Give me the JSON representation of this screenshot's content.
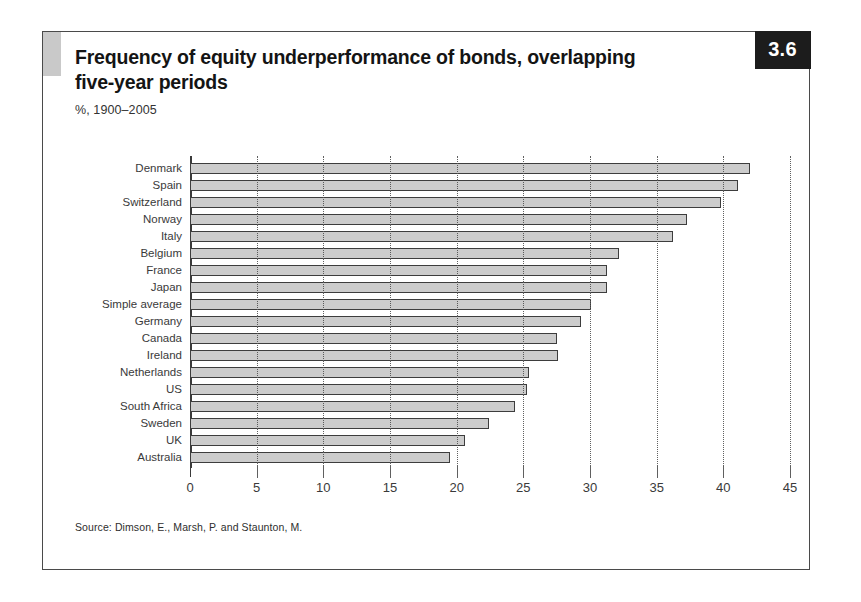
{
  "figure": {
    "badge_number": "3.6",
    "title": "Frequency of equity underperformance of bonds, overlapping five-year periods",
    "subtitle": "%, 1900–2005",
    "source": "Source: Dimson, E., Marsh, P. and Staunton, M."
  },
  "colors": {
    "bar_fill": "#cccccc",
    "bar_border": "#3d3d3d",
    "badge_background": "#1c1c1c",
    "badge_text": "#ffffff",
    "frame_border": "#4a4a4a",
    "accent_block": "#c9c9c9",
    "gridline": "#606060",
    "text": "#3a3a3a"
  },
  "chart_data": {
    "type": "bar",
    "orientation": "horizontal",
    "title": "Frequency of equity underperformance of bonds, overlapping five-year periods",
    "subtitle": "%, 1900–2005",
    "xlabel": "",
    "ylabel": "",
    "xlim": [
      0,
      45
    ],
    "xticks": [
      0,
      5,
      10,
      15,
      20,
      25,
      30,
      35,
      40,
      45
    ],
    "xtick_labels": [
      "0",
      "5",
      "10",
      "15",
      "20",
      "25",
      "30",
      "35",
      "40",
      "45"
    ],
    "grid": "vertical-dotted",
    "legend": "none",
    "categories": [
      "Denmark",
      "Spain",
      "Switzerland",
      "Norway",
      "Italy",
      "Belgium",
      "France",
      "Japan",
      "Simple average",
      "Germany",
      "Canada",
      "Ireland",
      "Netherlands",
      "US",
      "South Africa",
      "Sweden",
      "UK",
      "Australia"
    ],
    "values": [
      42.0,
      41.1,
      39.8,
      37.3,
      36.2,
      32.2,
      31.3,
      31.3,
      30.1,
      29.3,
      27.5,
      27.6,
      25.4,
      25.3,
      24.4,
      22.4,
      20.6,
      19.5
    ]
  }
}
